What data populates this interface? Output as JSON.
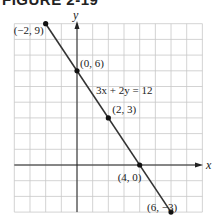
{
  "figure": {
    "title": "FIGURE 2-19"
  },
  "chart_data": {
    "type": "line",
    "title": "FIGURE 2-19",
    "xlabel": "x",
    "ylabel": "y",
    "xlim": [
      -4,
      8
    ],
    "ylim": [
      -3,
      9
    ],
    "grid": true,
    "equation_label": "3x + 2y = 12",
    "series": [
      {
        "name": "3x + 2y = 12",
        "points": [
          {
            "x": -2,
            "y": 9,
            "label": "(−2, 9)"
          },
          {
            "x": 0,
            "y": 6,
            "label": "(0, 6)"
          },
          {
            "x": 2,
            "y": 3,
            "label": "(2, 3)"
          },
          {
            "x": 4,
            "y": 0,
            "label": "(4, 0)"
          },
          {
            "x": 6,
            "y": -3,
            "label": "(6, −3)"
          }
        ]
      }
    ]
  }
}
